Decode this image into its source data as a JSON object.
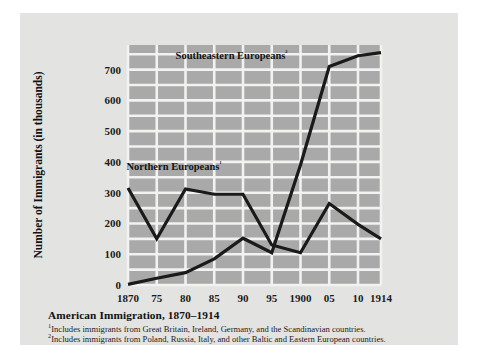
{
  "figure": {
    "caption_title": "American Immigration, 1870–1914",
    "footnotes": [
      {
        "marker": "1",
        "text": "Includes immigrants from Great Britain, Ireland, Germany, and the Scandinavian countries."
      },
      {
        "marker": "2",
        "text": "Includes immigrants from Poland, Russia, Italy, and other Baltic and Eastern European countries."
      }
    ],
    "colors": {
      "page_background": "#ffffff",
      "card_background": "#e3e3e1",
      "plot_background": "#a9a9a9",
      "gridline": "#f2f2f0",
      "line": "#1a1a1a",
      "text": "#141414"
    }
  },
  "chart_data": {
    "type": "line",
    "title": "American Immigration, 1870–1914",
    "xlabel": "",
    "ylabel": "Number of Immigrants (in thousands)",
    "x": [
      1870,
      1875,
      1880,
      1885,
      1890,
      1895,
      1900,
      1905,
      1910,
      1914
    ],
    "xtick_labels": [
      "1870",
      "75",
      "80",
      "85",
      "90",
      "95",
      "1900",
      "05",
      "10",
      "1914"
    ],
    "ytick_labels": [
      "0",
      "100",
      "200",
      "300",
      "400",
      "500",
      "600",
      "700"
    ],
    "yticks": [
      0,
      100,
      200,
      300,
      400,
      500,
      600,
      700
    ],
    "ylim": [
      0,
      780
    ],
    "xlim": [
      1870,
      1914
    ],
    "grid": true,
    "legend_position": "in-plot-annotations",
    "series": [
      {
        "name": "Northern Europeans",
        "marker": "1",
        "label": "Northern Europeans¹",
        "values": [
          315,
          150,
          312,
          295,
          295,
          130,
          105,
          265,
          197,
          150
        ]
      },
      {
        "name": "Southeastern Europeans",
        "marker": "2",
        "label": "Southeastern Europeans²",
        "values": [
          2,
          22,
          40,
          85,
          152,
          105,
          390,
          710,
          745,
          755
        ]
      }
    ],
    "annotations": [
      {
        "text": "Southeastern Europeans²",
        "x": 1888,
        "y": 735
      },
      {
        "text": "Northern Europeans¹",
        "x": 1878,
        "y": 375
      }
    ]
  }
}
